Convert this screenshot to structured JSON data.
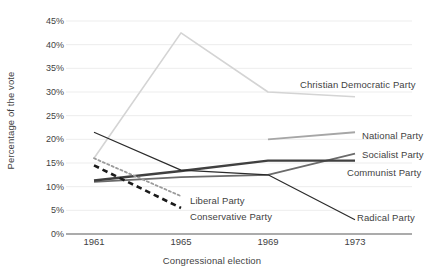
{
  "chart_data": {
    "type": "line",
    "title": "",
    "xlabel": "Congressional election",
    "ylabel": "Percentage of the vote",
    "categories": [
      "1961",
      "1965",
      "1969",
      "1973"
    ],
    "x_tick_labels": [
      "1961",
      "1965",
      "1969",
      "1973"
    ],
    "y_tick_labels": [
      "0%",
      "5%",
      "10%",
      "15%",
      "20%",
      "25%",
      "30%",
      "35%",
      "40%",
      "45%"
    ],
    "y_tick_values": [
      0,
      5,
      10,
      15,
      20,
      25,
      30,
      35,
      40,
      45
    ],
    "ylim": [
      0,
      45
    ],
    "y_unit": "%",
    "grid": "horizontal",
    "legend_position": "inline-right",
    "series": [
      {
        "name": "Christian Democratic Party",
        "values": [
          16.0,
          42.5,
          30.0,
          29.0
        ],
        "color": "#d4d4d4",
        "style": "solid",
        "width": 1.6,
        "label_x": 300,
        "label_y": 80
      },
      {
        "name": "National Party",
        "values": [
          null,
          null,
          20.0,
          21.5
        ],
        "color": "#a6a6a6",
        "style": "solid",
        "width": 1.8,
        "label_x": 362,
        "label_y": 131
      },
      {
        "name": "Socialist Party",
        "values": [
          11.0,
          12.0,
          12.5,
          17.0
        ],
        "color": "#6b6b6b",
        "style": "solid",
        "width": 1.8,
        "label_x": 362,
        "label_y": 150
      },
      {
        "name": "Communist Party",
        "values": [
          11.3,
          13.3,
          15.5,
          15.5
        ],
        "color": "#404040",
        "style": "solid",
        "width": 2.4,
        "label_x": 347,
        "label_y": 168
      },
      {
        "name": "Liberal Party",
        "values": [
          16.0,
          8.0,
          null,
          null
        ],
        "color": "#9a9a9a",
        "style": "dotted",
        "width": 1.8,
        "label_x": 190,
        "label_y": 196
      },
      {
        "name": "Conservative Party",
        "values": [
          14.5,
          5.5,
          null,
          null
        ],
        "color": "#1a1a1a",
        "style": "dashed",
        "width": 2.6,
        "label_x": 190,
        "label_y": 212
      },
      {
        "name": "Radical Party",
        "values": [
          21.5,
          13.5,
          12.5,
          3.0
        ],
        "color": "#2b2b2b",
        "style": "solid",
        "width": 1.2,
        "label_x": 357,
        "label_y": 213
      }
    ]
  }
}
